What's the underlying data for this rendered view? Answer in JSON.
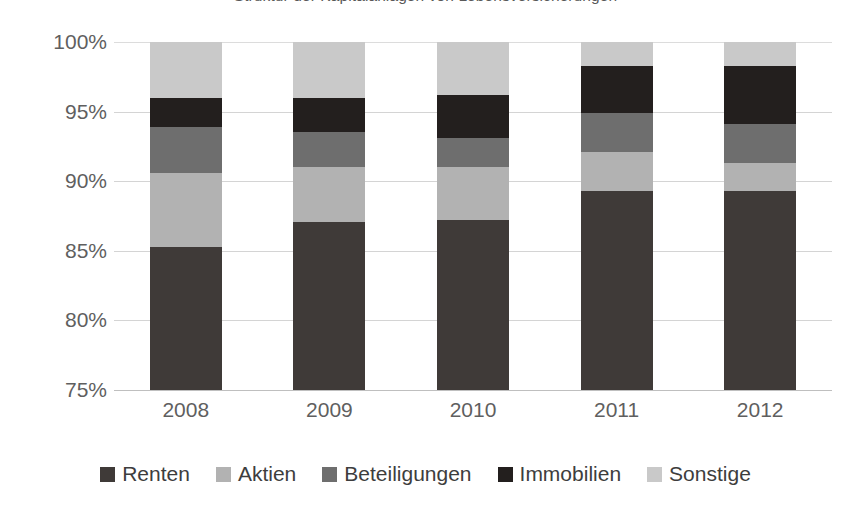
{
  "chart_data": {
    "type": "bar",
    "subtype": "stacked-bar-100-truncated",
    "title": "Struktur der Kapitalanlagen von Lebensversicherungen",
    "xlabel": "",
    "ylabel": "",
    "categories": [
      "2008",
      "2009",
      "2010",
      "2011",
      "2012"
    ],
    "ylim": [
      75,
      100
    ],
    "ytick_labels": [
      "100%",
      "95%",
      "90%",
      "85%",
      "80%",
      "75%"
    ],
    "ytick_values": [
      100,
      95,
      90,
      85,
      80,
      75
    ],
    "grid": true,
    "legend_position": "bottom",
    "series": [
      {
        "name": "Renten",
        "color": "#3f3a38",
        "values": [
          85.3,
          87.1,
          87.2,
          89.3,
          89.3
        ],
        "segment_sizes": [
          10.3,
          12.1,
          12.2,
          14.3,
          14.3
        ]
      },
      {
        "name": "Aktien",
        "color": "#b2b2b2",
        "values": [
          90.6,
          91.0,
          91.0,
          92.1,
          91.3
        ],
        "segment_sizes": [
          5.3,
          3.9,
          3.8,
          2.8,
          2.0
        ]
      },
      {
        "name": "Beteiligungen",
        "color": "#6e6e6e",
        "values": [
          93.9,
          93.5,
          93.1,
          94.9,
          94.1
        ],
        "segment_sizes": [
          3.3,
          2.5,
          2.1,
          2.8,
          2.8
        ]
      },
      {
        "name": "Immobilien",
        "color": "#231f1e",
        "values": [
          96.0,
          96.0,
          96.2,
          98.3,
          98.3
        ],
        "segment_sizes": [
          2.1,
          2.5,
          3.1,
          3.4,
          4.2
        ]
      },
      {
        "name": "Sonstige",
        "color": "#c9c9c9",
        "values": [
          100,
          100,
          100,
          100,
          100
        ],
        "segment_sizes": [
          4.0,
          4.0,
          3.8,
          1.7,
          1.7
        ]
      }
    ]
  },
  "legend": {
    "items": [
      {
        "label": "Renten",
        "color": "#3f3a38",
        "marker": "square-swatch-icon"
      },
      {
        "label": "Aktien",
        "color": "#b2b2b2",
        "marker": "square-swatch-icon"
      },
      {
        "label": "Beteiligungen",
        "color": "#6e6e6e",
        "marker": "square-swatch-icon"
      },
      {
        "label": "Immobilien",
        "color": "#231f1e",
        "marker": "square-swatch-icon"
      },
      {
        "label": "Sonstige",
        "color": "#c9c9c9",
        "marker": "square-swatch-icon"
      }
    ]
  },
  "style": {
    "background": "#ffffff",
    "gridline_color": "#d4d4d4",
    "axis_text_color": "#5f5f5f",
    "legend_text_color": "#3d3d3d",
    "title_color": "#595959"
  }
}
